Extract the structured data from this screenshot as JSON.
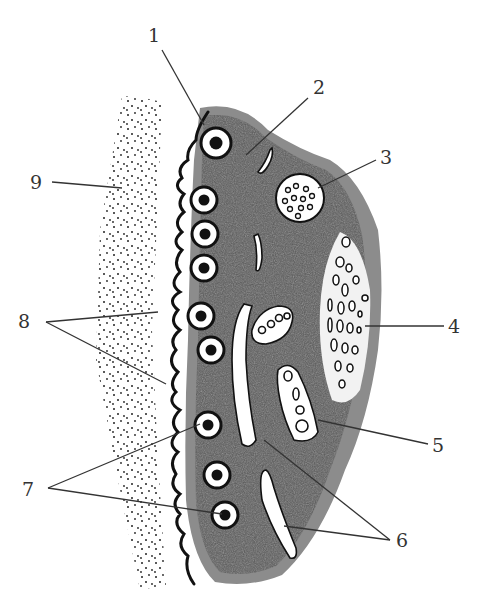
{
  "figure": {
    "type": "schematic cell cross-section (epithelial cell with secretory granules)",
    "labels": [
      {
        "id": "1",
        "text": "1",
        "x": 148,
        "y": 26
      },
      {
        "id": "2",
        "text": "2",
        "x": 313,
        "y": 78
      },
      {
        "id": "3",
        "text": "3",
        "x": 386,
        "y": 148
      },
      {
        "id": "4",
        "text": "4",
        "x": 448,
        "y": 317
      },
      {
        "id": "5",
        "text": "5",
        "x": 434,
        "y": 438
      },
      {
        "id": "6",
        "text": "6",
        "x": 398,
        "y": 508
      },
      {
        "id": "7",
        "text": "7",
        "x": 20,
        "y": 483
      },
      {
        "id": "8",
        "text": "8",
        "x": 18,
        "y": 309
      },
      {
        "id": "9",
        "text": "9",
        "x": 30,
        "y": 173
      }
    ],
    "colors": {
      "cytoplasm": "#5a5a5a",
      "cytoplasm_edge": "#8c8c8c",
      "outline": "#111111",
      "background": "#ffffff",
      "leader_line": "#333333",
      "stipple": "#222222"
    }
  }
}
